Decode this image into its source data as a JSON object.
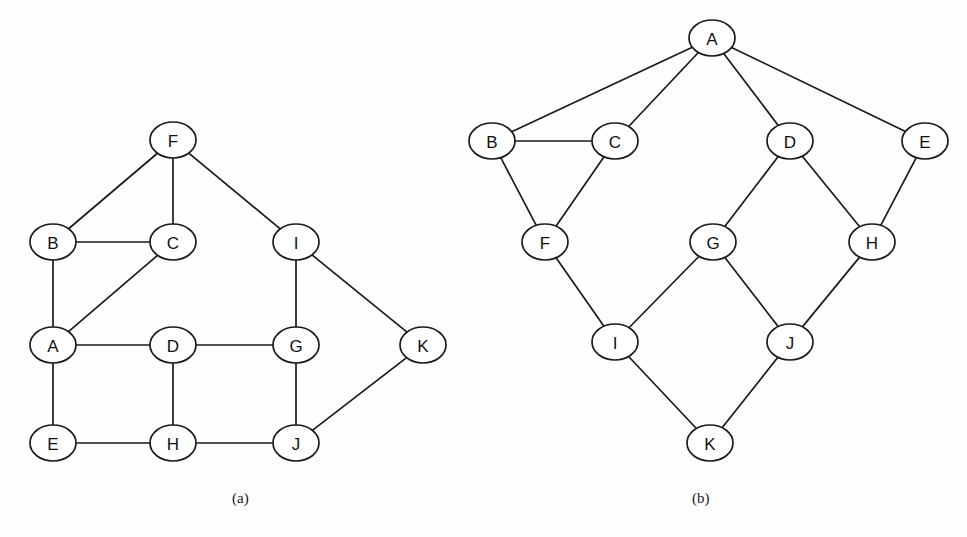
{
  "figure": {
    "background_color": "#fefefe",
    "stroke_color": "#1a1a1a",
    "node_fill_color": "#ffffff",
    "caption_a": "(a)",
    "caption_b": "(b)",
    "bottom_caption": "",
    "node_rx": 23,
    "node_ry": 18
  },
  "chart_data": {
    "type": "diagram",
    "title": "",
    "panels": [
      {
        "id": "a",
        "label": "(a)",
        "kind": "undirected-graph",
        "node_count": 11,
        "edge_count": 15,
        "nodes": [
          {
            "id": "F",
            "label": "F",
            "x": 173,
            "y": 140
          },
          {
            "id": "B",
            "label": "B",
            "x": 53,
            "y": 242
          },
          {
            "id": "C",
            "label": "C",
            "x": 173,
            "y": 242
          },
          {
            "id": "I",
            "label": "I",
            "x": 296,
            "y": 242
          },
          {
            "id": "A",
            "label": "A",
            "x": 53,
            "y": 345
          },
          {
            "id": "D",
            "label": "D",
            "x": 173,
            "y": 345
          },
          {
            "id": "G",
            "label": "G",
            "x": 296,
            "y": 345
          },
          {
            "id": "K",
            "label": "K",
            "x": 423,
            "y": 345
          },
          {
            "id": "E",
            "label": "E",
            "x": 53,
            "y": 443
          },
          {
            "id": "H",
            "label": "H",
            "x": 173,
            "y": 443
          },
          {
            "id": "J",
            "label": "J",
            "x": 296,
            "y": 443
          }
        ],
        "edges": [
          [
            "F",
            "B"
          ],
          [
            "F",
            "C"
          ],
          [
            "F",
            "I"
          ],
          [
            "B",
            "C"
          ],
          [
            "B",
            "A"
          ],
          [
            "C",
            "A"
          ],
          [
            "A",
            "D"
          ],
          [
            "A",
            "E"
          ],
          [
            "D",
            "G"
          ],
          [
            "D",
            "H"
          ],
          [
            "I",
            "G"
          ],
          [
            "I",
            "K"
          ],
          [
            "G",
            "J"
          ],
          [
            "K",
            "J"
          ],
          [
            "E",
            "H"
          ],
          [
            "H",
            "J"
          ]
        ]
      },
      {
        "id": "b",
        "label": "(b)",
        "kind": "undirected-graph",
        "node_count": 11,
        "edge_count": 14,
        "nodes": [
          {
            "id": "A",
            "label": "A",
            "x": 712,
            "y": 38
          },
          {
            "id": "B",
            "label": "B",
            "x": 492,
            "y": 141
          },
          {
            "id": "C",
            "label": "C",
            "x": 615,
            "y": 141
          },
          {
            "id": "D",
            "label": "D",
            "x": 790,
            "y": 141
          },
          {
            "id": "E",
            "label": "E",
            "x": 925,
            "y": 141
          },
          {
            "id": "F",
            "label": "F",
            "x": 545,
            "y": 242
          },
          {
            "id": "G",
            "label": "G",
            "x": 713,
            "y": 242
          },
          {
            "id": "H",
            "label": "H",
            "x": 872,
            "y": 242
          },
          {
            "id": "I",
            "label": "I",
            "x": 615,
            "y": 342
          },
          {
            "id": "J",
            "label": "J",
            "x": 790,
            "y": 342
          },
          {
            "id": "K",
            "label": "K",
            "x": 710,
            "y": 443
          }
        ],
        "edges": [
          [
            "A",
            "B"
          ],
          [
            "A",
            "C"
          ],
          [
            "A",
            "D"
          ],
          [
            "A",
            "E"
          ],
          [
            "B",
            "C"
          ],
          [
            "B",
            "F"
          ],
          [
            "C",
            "F"
          ],
          [
            "F",
            "I"
          ],
          [
            "D",
            "G"
          ],
          [
            "D",
            "H"
          ],
          [
            "E",
            "H"
          ],
          [
            "G",
            "I"
          ],
          [
            "G",
            "J"
          ],
          [
            "H",
            "J"
          ],
          [
            "I",
            "K"
          ],
          [
            "J",
            "K"
          ]
        ]
      }
    ]
  }
}
